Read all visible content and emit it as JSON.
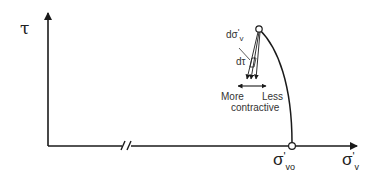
{
  "diagram": {
    "y_axis": {
      "label": "τ"
    },
    "x_axis": {
      "label_main": "σ",
      "label_prime": "'",
      "label_sub": "v",
      "has_break": true
    },
    "points": {
      "start": {
        "label_main": "σ",
        "label_prime": "'",
        "label_sub": "vo"
      }
    },
    "annotations": {
      "dsigma_main": "dσ",
      "dsigma_prime": "'",
      "dsigma_sub": "v",
      "dtau": "dτ",
      "more": "More",
      "less": "Less",
      "contractive": "contractive"
    },
    "colors": {
      "line": "#1a1a1a",
      "text": "#222222",
      "marker_fill": "#ffffff"
    }
  }
}
